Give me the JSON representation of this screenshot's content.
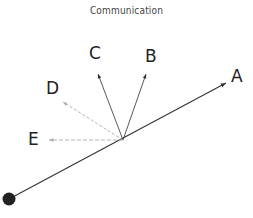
{
  "diagram": {
    "title": "Communication",
    "labels": {
      "a": "A",
      "b": "B",
      "c": "C",
      "d": "D",
      "e": "E"
    },
    "colors": {
      "solid_line": "#333333",
      "dashed_line": "#aaaaaa",
      "origin_dot": "#222222"
    }
  }
}
